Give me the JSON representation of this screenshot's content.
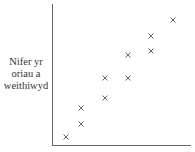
{
  "chart_data": {
    "type": "scatter",
    "title": "",
    "xlabel": "",
    "ylabel": "Nifer yr oriau a weithiwyd",
    "ylabel_lines": [
      "Nifer yr",
      "oriau a",
      "weithiwyd"
    ],
    "grid": false,
    "legend": null,
    "marker": "x",
    "axis_ranges": {
      "x": [
        0,
        10
      ],
      "y": [
        0,
        10
      ]
    },
    "points_px": [
      {
        "x": 66,
        "y": 137
      },
      {
        "x": 81,
        "y": 124
      },
      {
        "x": 81,
        "y": 108
      },
      {
        "x": 105,
        "y": 98
      },
      {
        "x": 105,
        "y": 78
      },
      {
        "x": 128,
        "y": 78
      },
      {
        "x": 128,
        "y": 55
      },
      {
        "x": 151,
        "y": 51
      },
      {
        "x": 151,
        "y": 36
      },
      {
        "x": 173,
        "y": 20
      }
    ],
    "points": [
      {
        "x": 1.0,
        "y": 0.6
      },
      {
        "x": 2.0,
        "y": 1.5
      },
      {
        "x": 2.0,
        "y": 2.6
      },
      {
        "x": 3.6,
        "y": 3.3
      },
      {
        "x": 3.6,
        "y": 4.7
      },
      {
        "x": 5.1,
        "y": 4.7
      },
      {
        "x": 5.1,
        "y": 6.3
      },
      {
        "x": 6.7,
        "y": 6.6
      },
      {
        "x": 6.7,
        "y": 7.6
      },
      {
        "x": 8.1,
        "y": 8.8
      }
    ]
  },
  "colors": {
    "axis": "#555555",
    "marker": "#555555",
    "text": "#333333"
  }
}
